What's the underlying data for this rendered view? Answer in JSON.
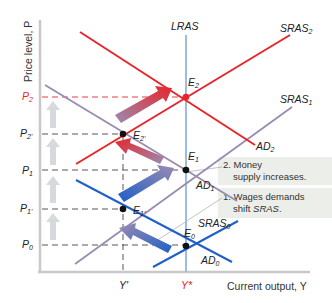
{
  "axes": {
    "y_title": "Price level, P",
    "x_title": "Current output, Y",
    "y_ticks": [
      {
        "label": "P2",
        "base": "P",
        "sub": "2",
        "y": 97,
        "color": "#e8252a"
      },
      {
        "label": "P2'",
        "base": "P",
        "sub": "2'",
        "y": 134,
        "color": "#222222"
      },
      {
        "label": "P1",
        "base": "P",
        "sub": "1",
        "y": 170,
        "color": "#222222"
      },
      {
        "label": "P1'",
        "base": "P",
        "sub": "1'",
        "y": 209,
        "color": "#222222"
      },
      {
        "label": "P0",
        "base": "P",
        "sub": "0",
        "y": 245,
        "color": "#222222"
      }
    ],
    "x_ticks": [
      {
        "label": "Y'",
        "x": 123,
        "color": "#222222"
      },
      {
        "label": "Y*",
        "x": 186,
        "color": "#e8252a"
      }
    ]
  },
  "curves": {
    "lras": {
      "label": "LRAS",
      "color": "#9bbbe8"
    },
    "sras2": {
      "label": "SRAS",
      "sub": "2",
      "color": "#e8252a"
    },
    "ad2": {
      "label": "AD",
      "sub": "2",
      "color": "#e8252a"
    },
    "sras1": {
      "label": "SRAS",
      "sub": "1",
      "color": "#9a8bb0"
    },
    "ad1": {
      "label": "AD",
      "sub": "1",
      "color": "#9a8bb0"
    },
    "sras0": {
      "label": "SRAS",
      "sub": "0",
      "color": "#1f5fc9"
    },
    "ad0": {
      "label": "AD",
      "sub": "0",
      "color": "#1f5fc9"
    }
  },
  "equilibria": [
    {
      "label": "E",
      "sub": "2",
      "x": 186,
      "y": 97,
      "color": "#e8252a"
    },
    {
      "label": "E",
      "sub": "2'",
      "x": 123,
      "y": 134,
      "color": "#111111"
    },
    {
      "label": "E",
      "sub": "1",
      "x": 186,
      "y": 170,
      "color": "#111111"
    },
    {
      "label": "E",
      "sub": "1'",
      "x": 123,
      "y": 209,
      "color": "#111111"
    },
    {
      "label": "E",
      "sub": "0",
      "x": 186,
      "y": 246,
      "color": "#111111"
    }
  ],
  "annotations": {
    "note2_line1": "2. Money",
    "note2_line2": "supply increases.",
    "note1_line1": "1. Wages demands",
    "note1_line2_prefix": "shift ",
    "note1_line2_italic": "SRAS",
    "note1_line2_suffix": "."
  },
  "colors": {
    "red": "#e8252a",
    "blue": "#1f5fc9",
    "purple": "#9a8bb0",
    "lras": "#9bbbe8",
    "axis": "#c8c8c8",
    "up_arrow": "#d6dadd",
    "note_bg": "#eceeea"
  }
}
